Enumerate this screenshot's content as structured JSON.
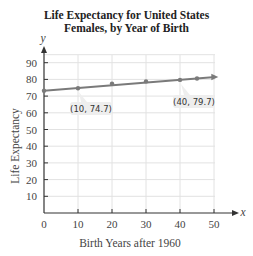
{
  "chart_data": {
    "type": "line",
    "title": "Life Expectancy for United States Females, by Year of Birth",
    "title_lines": [
      "Life Expectancy for United States",
      "Females, by Year of Birth"
    ],
    "xlabel": "Birth Years after 1960",
    "ylabel": "Life Expectancy",
    "x_axis_symbol": "x",
    "y_axis_symbol": "y",
    "xlim": [
      0,
      50
    ],
    "ylim": [
      0,
      90
    ],
    "x_ticks": [
      0,
      10,
      20,
      30,
      40,
      50
    ],
    "y_ticks": [
      10,
      20,
      30,
      40,
      50,
      60,
      70,
      80,
      90
    ],
    "grid": true,
    "series": [
      {
        "name": "Life Expectancy",
        "x": [
          0,
          10,
          20,
          30,
          40,
          45
        ],
        "y": [
          73.2,
          74.7,
          77.5,
          78.8,
          79.7,
          80.5
        ]
      }
    ],
    "annotations": [
      {
        "label": "(10, 74.7)",
        "x": 10,
        "y": 74.7
      },
      {
        "label": "(40, 79.7)",
        "x": 40,
        "y": 79.7
      }
    ],
    "line_color": "#7a7a7a"
  }
}
